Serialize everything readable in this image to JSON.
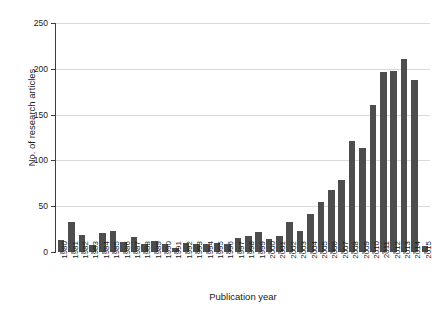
{
  "chart_data": {
    "type": "bar",
    "title": "",
    "xlabel": "Publication year",
    "ylabel": "No. of research articles",
    "ylim": [
      0,
      250
    ],
    "yticks": [
      0,
      50,
      100,
      150,
      200,
      250
    ],
    "grid": true,
    "legend": "none",
    "bar_color": "#4d4d4d",
    "grid_color": "#d9d9d9",
    "categories": [
      "1980",
      "1981",
      "1982",
      "1983",
      "1984",
      "1985",
      "1986",
      "1987",
      "1988",
      "1989",
      "1990",
      "1991",
      "1992",
      "1993",
      "1994",
      "1995",
      "1996",
      "1997",
      "1998",
      "1999",
      "2000",
      "2001",
      "2002",
      "2003",
      "2004",
      "2005",
      "2006",
      "2007",
      "2008",
      "2009",
      "2010",
      "2011",
      "2012",
      "2013",
      "2014",
      "2015"
    ],
    "values": [
      13,
      33,
      19,
      8,
      21,
      23,
      11,
      16,
      9,
      12,
      9,
      4,
      10,
      9,
      9,
      10,
      9,
      15,
      17,
      22,
      14,
      18,
      33,
      23,
      42,
      55,
      68,
      79,
      121,
      114,
      161,
      196,
      198,
      211,
      188,
      7
    ]
  }
}
